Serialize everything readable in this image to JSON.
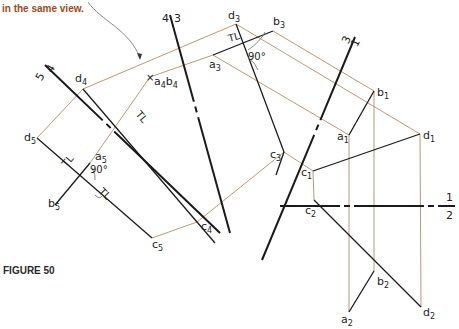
{
  "caption": "in the same view.",
  "figure_label": "FIGURE 50",
  "fold_lines": {
    "f12": {
      "upper": "1",
      "lower": "2"
    },
    "f43": {
      "left": "4",
      "right": "3"
    },
    "f31": {
      "left": "3",
      "right": "1"
    },
    "f54": {
      "left": "5",
      "right": "4"
    }
  },
  "points": {
    "a1": {
      "b": "a",
      "s": "1"
    },
    "b1": {
      "b": "b",
      "s": "1"
    },
    "c1": {
      "b": "c",
      "s": "1"
    },
    "d1": {
      "b": "d",
      "s": "1"
    },
    "a2": {
      "b": "a",
      "s": "2"
    },
    "b2": {
      "b": "b",
      "s": "2"
    },
    "c2": {
      "b": "c",
      "s": "2"
    },
    "d2": {
      "b": "d",
      "s": "2"
    },
    "a3": {
      "b": "a",
      "s": "3"
    },
    "b3": {
      "b": "b",
      "s": "3"
    },
    "c3": {
      "b": "c",
      "s": "3"
    },
    "d3": {
      "b": "d",
      "s": "3"
    },
    "a4b4": {
      "b1": "a",
      "s1": "4",
      "b2": "b",
      "s2": "4"
    },
    "c4": {
      "b": "c",
      "s": "4"
    },
    "d4": {
      "b": "d",
      "s": "4"
    },
    "a5": {
      "b": "a",
      "s": "5"
    },
    "b5": {
      "b": "b",
      "s": "5"
    },
    "c5": {
      "b": "c",
      "s": "5"
    },
    "d5": {
      "b": "d",
      "s": "5"
    }
  },
  "annotations": {
    "tl": "TL",
    "angle": "90°"
  }
}
